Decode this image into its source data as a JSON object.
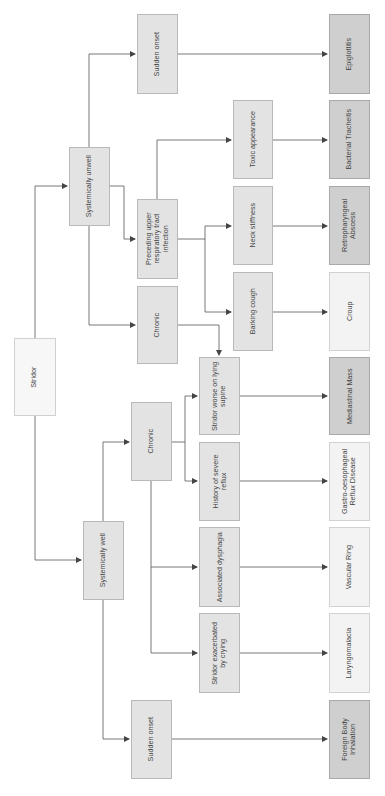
{
  "diagram": {
    "orientation": "rotated-90ccw",
    "colors": {
      "root": "#f7f7f7",
      "intermediate": "#e3e3e3",
      "outcome_light": "#f3f3f3",
      "outcome_dark": "#cfcfcf",
      "line": "#555555"
    },
    "nodes": {
      "stridor": {
        "label": "Stridor"
      },
      "systemically_unwell": {
        "label": "Systemically unwell"
      },
      "systemically_well": {
        "label": "Systemically well"
      },
      "unwell_sudden_onset": {
        "label": "Sudden onset"
      },
      "preceding_urti": {
        "label": "Preceding upper\nrespiratory tract\ninfection"
      },
      "unwell_chronic": {
        "label": "Chronic"
      },
      "toxic_appearance": {
        "label": "Toxic appearance"
      },
      "neck_stiffness": {
        "label": "Neck stiffness"
      },
      "barking_cough": {
        "label": "Barking cough"
      },
      "well_chronic": {
        "label": "Chronic"
      },
      "well_sudden_onset": {
        "label": "Sudden onset"
      },
      "stridor_supine": {
        "label": "Stridor worse on lying\nsupine"
      },
      "severe_reflux": {
        "label": "History of severe\nreflux"
      },
      "assoc_dysphagia": {
        "label": "Associated dysphagia"
      },
      "stridor_crying": {
        "label": "Stridor exacerbated\nby crying"
      },
      "epiglottitis": {
        "label": "Epiglottitis"
      },
      "bacterial_tracheitis": {
        "label": "Bacterial Tracheitis"
      },
      "retropharyngeal_abscess": {
        "label": "Retropharyngeal\nAbscess"
      },
      "croup": {
        "label": "Croup"
      },
      "mediastinal_mass": {
        "label": "Mediastinal Mass"
      },
      "gord": {
        "label": "Gastro-oesophageal\nReflux Disease"
      },
      "vascular_ring": {
        "label": "Vascular Ring"
      },
      "laryngomalacia": {
        "label": "Laryngomalacia"
      },
      "foreign_body": {
        "label": "Foreign Body\nInhalation"
      }
    },
    "edges": [
      [
        "stridor",
        "systemically_unwell"
      ],
      [
        "stridor",
        "systemically_well"
      ],
      [
        "systemically_unwell",
        "unwell_sudden_onset"
      ],
      [
        "systemically_unwell",
        "preceding_urti"
      ],
      [
        "systemically_unwell",
        "unwell_chronic"
      ],
      [
        "preceding_urti",
        "toxic_appearance"
      ],
      [
        "preceding_urti",
        "neck_stiffness"
      ],
      [
        "preceding_urti",
        "barking_cough"
      ],
      [
        "unwell_chronic",
        "stridor_supine"
      ],
      [
        "unwell_sudden_onset",
        "epiglottitis"
      ],
      [
        "toxic_appearance",
        "bacterial_tracheitis"
      ],
      [
        "neck_stiffness",
        "retropharyngeal_abscess"
      ],
      [
        "barking_cough",
        "croup"
      ],
      [
        "systemically_well",
        "well_chronic"
      ],
      [
        "systemically_well",
        "well_sudden_onset"
      ],
      [
        "well_chronic",
        "stridor_supine"
      ],
      [
        "well_chronic",
        "severe_reflux"
      ],
      [
        "well_chronic",
        "assoc_dysphagia"
      ],
      [
        "well_chronic",
        "stridor_crying"
      ],
      [
        "stridor_supine",
        "mediastinal_mass"
      ],
      [
        "severe_reflux",
        "gord"
      ],
      [
        "assoc_dysphagia",
        "vascular_ring"
      ],
      [
        "stridor_crying",
        "laryngomalacia"
      ],
      [
        "well_sudden_onset",
        "foreign_body"
      ]
    ]
  }
}
